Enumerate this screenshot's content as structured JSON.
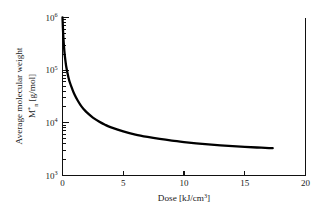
{
  "figure": {
    "background_color": "#ffffff",
    "curve_color": "#000000",
    "axis_color": "#111111"
  },
  "chart_data": {
    "type": "line",
    "title": "",
    "subtitle": "",
    "xlabel_text": "Dose [kJ/cm",
    "xlabel_sup": "3",
    "xlabel_tail": "]",
    "xlabel_full": "Dose [kJ/cm3]",
    "ylabel_line1": "Average molecular weight",
    "ylabel_line2_base": "M",
    "ylabel_line2_sup": "*",
    "ylabel_line2_sub": "n",
    "ylabel_line2_tail": " [g/mol]",
    "ylabel_full": "Average molecular weight M*n [g/mol]",
    "xlim": [
      0,
      20
    ],
    "ylim": [
      1000,
      1000000
    ],
    "yscale": "log",
    "xscale": "linear",
    "grid": false,
    "legend": false,
    "xticks": [
      {
        "value": 0,
        "label": "0"
      },
      {
        "value": 5,
        "label": "5"
      },
      {
        "value": 10,
        "label": "10"
      },
      {
        "value": 15,
        "label": "15"
      },
      {
        "value": 20,
        "label": "20"
      }
    ],
    "yticks": [
      {
        "value": 1000,
        "base": "10",
        "exp": "3"
      },
      {
        "value": 10000,
        "base": "10",
        "exp": "4"
      },
      {
        "value": 100000,
        "base": "10",
        "exp": "5"
      },
      {
        "value": 1000000,
        "base": "10",
        "exp": "6"
      }
    ],
    "series": [
      {
        "name": "Average molecular weight vs dose",
        "x": [
          0.0,
          0.05,
          0.1,
          0.15,
          0.2,
          0.25,
          0.3,
          0.4,
          0.5,
          0.6,
          0.8,
          1.0,
          1.25,
          1.5,
          1.75,
          2.0,
          2.5,
          3.0,
          3.5,
          4.0,
          5.0,
          6.0,
          7.0,
          8.0,
          9.0,
          10.0,
          11.0,
          12.0,
          13.0,
          14.0,
          15.0,
          16.0,
          17.0,
          17.3
        ],
        "y": [
          1000000,
          520000,
          330000,
          235000,
          180000,
          145000,
          120000,
          90000,
          71000,
          59000,
          44000,
          34000,
          26500,
          21500,
          18200,
          15800,
          12600,
          10600,
          9200,
          8200,
          6900,
          6000,
          5400,
          4950,
          4600,
          4320,
          4080,
          3890,
          3730,
          3600,
          3490,
          3400,
          3320,
          3300
        ]
      }
    ]
  }
}
